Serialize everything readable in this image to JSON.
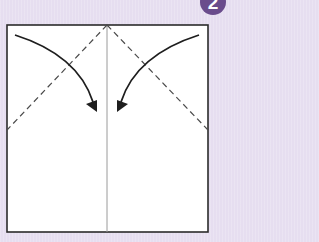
{
  "step": {
    "number": "2",
    "badge_color": "#6a4c8c"
  },
  "colors": {
    "background": "#e6def0",
    "paper": "#ffffff",
    "outline": "#2b2b2b",
    "crease": "#9a9a9a",
    "dashed": "#4a4a4a",
    "arrow": "#1e1e1e"
  },
  "diagram": {
    "paper_square": {
      "x": 7,
      "y": 25,
      "width": 201,
      "height": 207
    },
    "center_crease_x": 107,
    "valley_folds": [
      {
        "from": [
          107,
          25
        ],
        "to": [
          7,
          130
        ]
      },
      {
        "from": [
          107,
          25
        ],
        "to": [
          208,
          130
        ]
      }
    ],
    "arrows": [
      {
        "name": "left-corner-fold",
        "from": [
          15,
          35
        ],
        "to": [
          96,
          110
        ]
      },
      {
        "name": "right-corner-fold",
        "from": [
          199,
          35
        ],
        "to": [
          118,
          110
        ]
      }
    ]
  }
}
